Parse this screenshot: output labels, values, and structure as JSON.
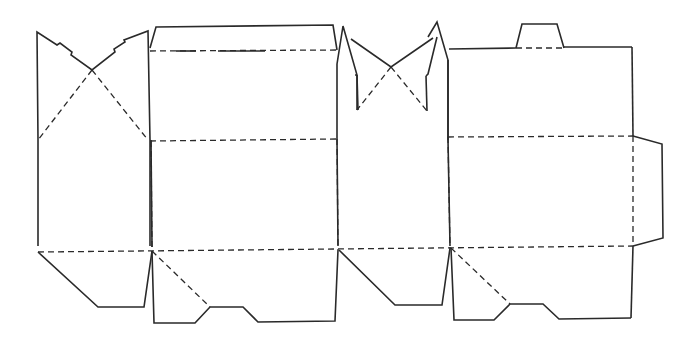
{
  "diagram": {
    "type": "box-dieline",
    "width": 696,
    "height": 348,
    "colors": {
      "line": "#2a2a2a",
      "background": "#ffffff"
    },
    "stroke": {
      "cut_width": 1.6,
      "fold_width": 1.3,
      "fold_dash": "6,4"
    },
    "cut_lines": [
      {
        "name": "left-glue-panel-outline",
        "points": "38,246 38,140 37,32 57,45 60,43 72,52 71,55 92,70 115,52 114,49 125,42 124,40 148,31 150,140 150,246"
      },
      {
        "name": "front-top-flap-outline",
        "points": "150,48 156,27 333,25 337,50"
      },
      {
        "name": "front-top-slot-left",
        "points": "176,51 196,51"
      },
      {
        "name": "front-top-slot-right",
        "points": "218,51 265,51"
      },
      {
        "name": "front-panel-right-edge",
        "points": "337,64 337,140 338,246"
      },
      {
        "name": "front-panel-left-edge",
        "points": "151,140 152,247"
      },
      {
        "name": "center-flap-left-spike",
        "points": "337,64 343,26 349,47 357,75 357,110"
      },
      {
        "name": "center-flap-right-spike",
        "points": "428,37 437,22 448,60 448,140"
      },
      {
        "name": "center-flap-left-diag",
        "points": "351,39 391,67 433,38"
      },
      {
        "name": "center-flap-left-inner",
        "points": "357,75 358,110"
      },
      {
        "name": "center-flap-right-inner",
        "points": "426,76 427,111"
      },
      {
        "name": "center-flap-left-notch",
        "points": "355,75 357,75"
      },
      {
        "name": "center-flap-right-notch",
        "points": "426,76 428,74 437,37"
      },
      {
        "name": "back-panel-outline",
        "points": "448,60 448,140 450,246"
      },
      {
        "name": "back-top-edge-left",
        "points": "449,49 516,48"
      },
      {
        "name": "back-top-tab",
        "points": "516,48 522,24 557,24 564,48"
      },
      {
        "name": "back-top-edge-right",
        "points": "564,47 632,47"
      },
      {
        "name": "back-panel-right-edge",
        "points": "632,47 633,136"
      },
      {
        "name": "side-tuck-flap",
        "points": "633,136 662,144 663,238 633,246"
      },
      {
        "name": "back-panel-right-lower",
        "points": "633,246 631,318"
      },
      {
        "name": "left-bottom-flap",
        "points": "38,252 98,307 144,307 152,251"
      },
      {
        "name": "front-bottom-flap",
        "points": "152,251 154,323 195,323 210,307 243,307 258,322 335,321 338,250"
      },
      {
        "name": "center-bottom-flap",
        "points": "339,250 395,305 442,305 450,248"
      },
      {
        "name": "back-bottom-flap",
        "points": "451,248 454,320 494,320 510,304 543,304 559,319 631,318"
      }
    ],
    "fold_lines": [
      {
        "name": "left-panel-diag-fold-a",
        "points": "92,70 38,140"
      },
      {
        "name": "left-panel-diag-fold-b",
        "points": "92,70 148,140"
      },
      {
        "name": "front-top-fold",
        "points": "150,51 337,50"
      },
      {
        "name": "center-flap-diag-fold-a",
        "points": "391,67 357,110"
      },
      {
        "name": "center-flap-diag-fold-b",
        "points": "391,67 427,111"
      },
      {
        "name": "back-top-tab-fold",
        "points": "516,48 564,48"
      },
      {
        "name": "upper-horizontal-fold-left",
        "points": "150,141 337,139"
      },
      {
        "name": "upper-horizontal-fold-right",
        "points": "448,137 633,136"
      },
      {
        "name": "front-left-vertical-fold",
        "points": "151,141 152,250"
      },
      {
        "name": "front-right-vertical-fold",
        "points": "337,139 338,250"
      },
      {
        "name": "back-left-vertical-fold",
        "points": "448,137 450,248"
      },
      {
        "name": "back-right-vertical-fold",
        "points": "633,136 633,246"
      },
      {
        "name": "lower-horizontal-fold",
        "points": "38,252 633,246"
      },
      {
        "name": "front-bottom-diag-fold",
        "points": "152,251 210,307"
      },
      {
        "name": "back-bottom-diag-fold",
        "points": "451,248 510,304"
      }
    ]
  }
}
